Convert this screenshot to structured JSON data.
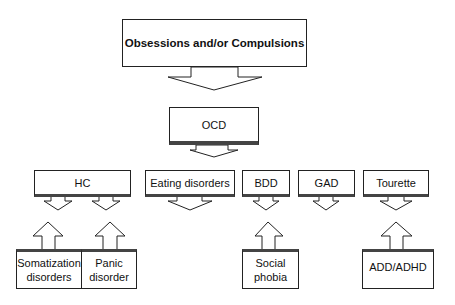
{
  "diagram": {
    "top": {
      "label": "Obsessions and/or Compulsions"
    },
    "center": {
      "label": "OCD"
    },
    "related": [
      {
        "label": "HC"
      },
      {
        "label": "Eating disorders"
      },
      {
        "label": "BDD"
      },
      {
        "label": "GAD"
      },
      {
        "label": "Tourette"
      }
    ],
    "contributing": [
      {
        "label": "Somatization disorders",
        "target": "HC"
      },
      {
        "label": "Panic disorder",
        "target": "HC"
      },
      {
        "label": "Social phobia",
        "target": "BDD"
      },
      {
        "label": "ADD/ADHD",
        "target": "Tourette"
      }
    ]
  }
}
